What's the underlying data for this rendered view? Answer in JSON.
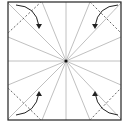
{
  "diagram": {
    "type": "origami-fold-diagram",
    "square": {
      "x": 8,
      "y": 2,
      "size": 113
    },
    "center": {
      "x": 66,
      "y": 61
    },
    "radial_crease_count": 16,
    "corner_folds": [
      {
        "corner": "top-left",
        "direction": "fold-in"
      },
      {
        "corner": "top-right",
        "direction": "fold-in"
      },
      {
        "corner": "bottom-left",
        "direction": "fold-in"
      },
      {
        "corner": "bottom-right",
        "direction": "fold-in"
      }
    ],
    "colors": {
      "border": "#222222",
      "crease": "#aaaaaa",
      "dashed": "#555555",
      "arrow": "#222222"
    }
  }
}
